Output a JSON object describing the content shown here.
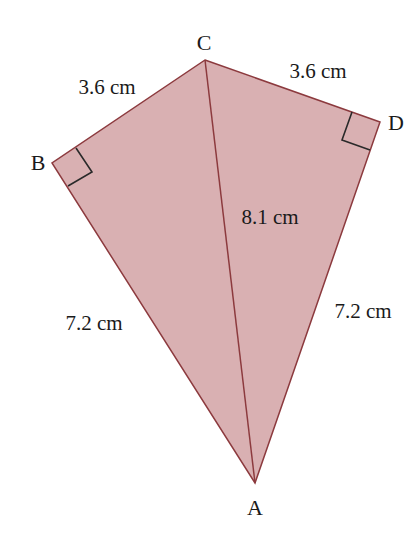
{
  "diagram": {
    "type": "kite",
    "colors": {
      "fill": "#d9b0b2",
      "stroke": "#8c3a3e",
      "right_angle_marker": "#2a2a2a",
      "text": "#1a1a1a"
    },
    "vertices": {
      "A": {
        "label": "A",
        "x": 255,
        "y": 483
      },
      "B": {
        "label": "B",
        "x": 52,
        "y": 163
      },
      "C": {
        "label": "C",
        "x": 205,
        "y": 60
      },
      "D": {
        "label": "D",
        "x": 380,
        "y": 122
      }
    },
    "measurements": {
      "BC": "3.6 cm",
      "CD": "3.6 cm",
      "AC": "8.1 cm",
      "AB": "7.2 cm",
      "AD": "7.2 cm"
    },
    "right_angles": [
      "B",
      "D"
    ]
  }
}
